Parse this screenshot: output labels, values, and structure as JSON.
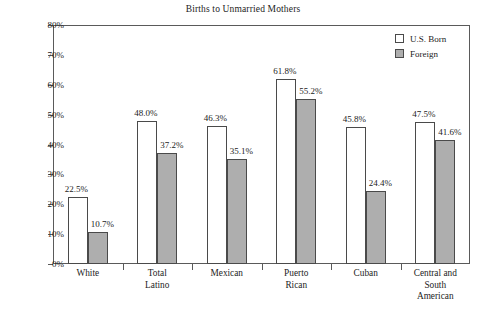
{
  "chart_data": {
    "type": "bar",
    "title": "Births to Unmarried Mothers",
    "xlabel": "",
    "ylabel": "",
    "ylim": [
      0,
      80
    ],
    "ytick_values": [
      0,
      10,
      20,
      30,
      40,
      50,
      60,
      70,
      80
    ],
    "ytick_labels": [
      "0%",
      "10%",
      "20%",
      "30%",
      "40%",
      "50%",
      "60%",
      "70%",
      "80%"
    ],
    "grid": false,
    "legend_position": "top-right",
    "categories": [
      "White",
      "Total Latino",
      "Mexican",
      "Puerto Rican",
      "Cuban",
      "Central and South American"
    ],
    "category_label_lines": [
      [
        "White"
      ],
      [
        "Total",
        "Latino"
      ],
      [
        "Mexican"
      ],
      [
        "Puerto",
        "Rican"
      ],
      [
        "Cuban"
      ],
      [
        "Central and",
        "South",
        "American"
      ]
    ],
    "series": [
      {
        "name": "U.S. Born",
        "color": "#ffffff",
        "values": [
          22.5,
          48.0,
          46.3,
          61.8,
          45.8,
          47.5
        ],
        "value_labels": [
          "22.5%",
          "48.0%",
          "46.3%",
          "61.8%",
          "45.8%",
          "47.5%"
        ]
      },
      {
        "name": "Foreign",
        "color": "#aeaeae",
        "values": [
          10.7,
          37.2,
          35.1,
          55.2,
          24.4,
          41.6
        ],
        "value_labels": [
          "10.7%",
          "37.2%",
          "35.1%",
          "55.2%",
          "24.4%",
          "41.6%"
        ]
      }
    ]
  },
  "legend": {
    "entries": [
      {
        "label": "U.S. Born",
        "swatch": "white"
      },
      {
        "label": "Foreign",
        "swatch": "gray"
      }
    ]
  },
  "colors": {
    "bar_us_born": "#ffffff",
    "bar_foreign": "#aeaeae",
    "bar_border": "#4a4a4a",
    "axis": "#5a5a5a",
    "text": "#232323",
    "background": "#ffffff"
  }
}
